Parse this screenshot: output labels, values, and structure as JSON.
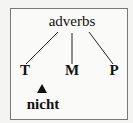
{
  "diagram": {
    "root": "adverbs",
    "leaves": [
      "T",
      "M",
      "P"
    ],
    "marker": "triangle-up",
    "marker_label": "nicht"
  },
  "colors": {
    "line": "#222222",
    "text": "#111111",
    "border": "#777777"
  }
}
